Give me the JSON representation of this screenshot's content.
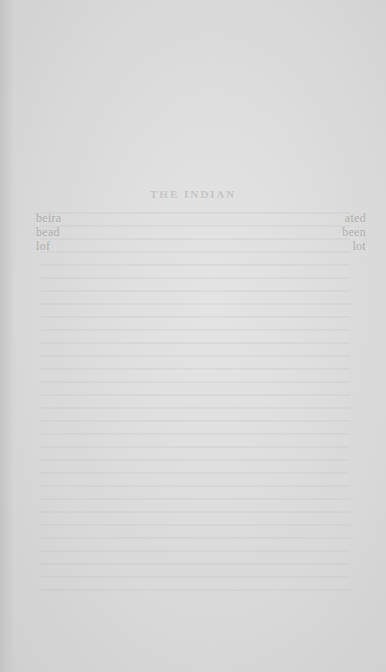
{
  "page": {
    "type": "blank scanned book page with reverse-side bleed-through",
    "background_color": "#dcdcdc"
  },
  "bleed_through": {
    "heading": "THE INDIAN",
    "left_margin": [
      "beira",
      "bead",
      "lof"
    ],
    "right_margin": [
      "ated",
      "been",
      "lot"
    ]
  }
}
